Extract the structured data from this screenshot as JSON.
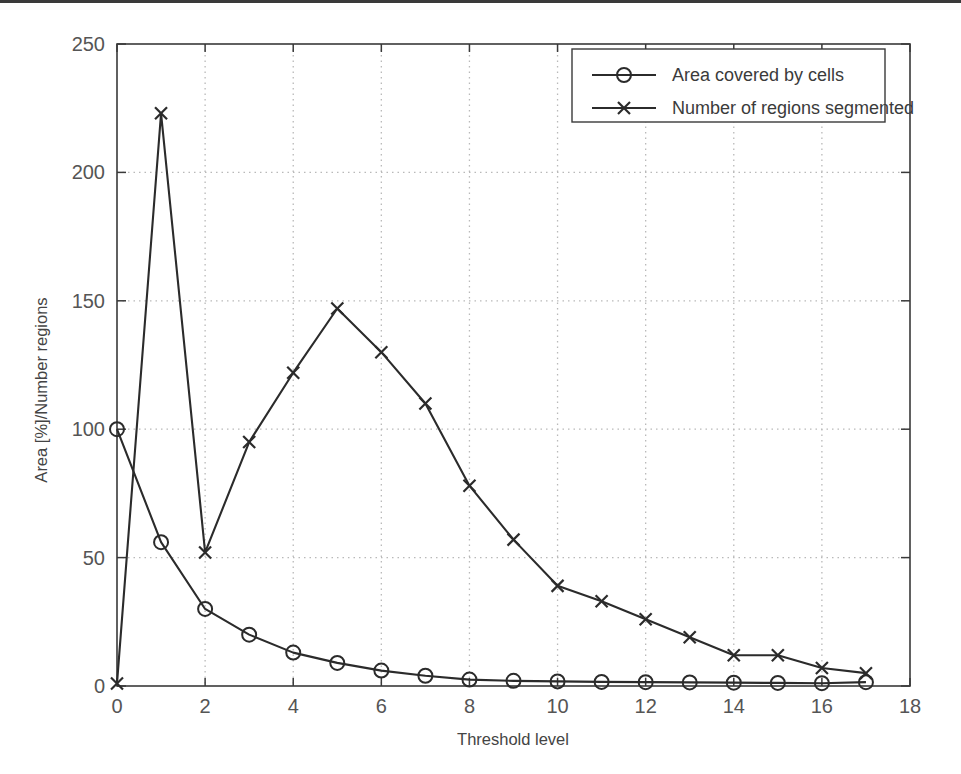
{
  "chart_data": {
    "type": "line",
    "title": "",
    "xlabel": "Threshold level",
    "ylabel": "Area [%]/Number regions",
    "xlim": [
      0,
      18
    ],
    "ylim": [
      0,
      250
    ],
    "xticks": [
      "0",
      "2",
      "4",
      "6",
      "8",
      "10",
      "12",
      "14",
      "16",
      "18"
    ],
    "xtick_values": [
      0,
      2,
      4,
      6,
      8,
      10,
      12,
      14,
      16,
      18
    ],
    "yticks": [
      "0",
      "50",
      "100",
      "150",
      "200",
      "250"
    ],
    "ytick_values": [
      0,
      50,
      100,
      150,
      200,
      250
    ],
    "grid": true,
    "grid_style": "dotted",
    "legend_position": "top-right",
    "x": [
      0,
      1,
      2,
      3,
      4,
      5,
      6,
      7,
      8,
      9,
      10,
      11,
      12,
      13,
      14,
      15,
      16,
      17
    ],
    "series": [
      {
        "name": "Area covered by cells",
        "marker": "circle",
        "color": "#2b2b2b",
        "values": [
          100,
          56,
          30,
          20,
          13,
          9,
          6,
          4,
          2.5,
          2,
          1.8,
          1.6,
          1.5,
          1.4,
          1.3,
          1.2,
          1.1,
          1.5
        ]
      },
      {
        "name": "Number of regions segmented",
        "marker": "x",
        "color": "#2b2b2b",
        "values": [
          1,
          223,
          52,
          95,
          122,
          147,
          130,
          110,
          78,
          57,
          39,
          33,
          26,
          19,
          12,
          12,
          7,
          5
        ]
      }
    ]
  },
  "legend": {
    "entries": [
      {
        "label": "Area covered by cells",
        "marker": "circle-marker"
      },
      {
        "label": "Number of regions segmented",
        "marker": "x-marker"
      }
    ]
  },
  "axes": {
    "x_label": "Threshold level",
    "y_label": "Area [%]/Number regions"
  },
  "colors": {
    "line": "#2b2b2b",
    "grid": "#b9b9b9",
    "axis": "#3a3a3a",
    "text": "#4a4a4a"
  }
}
